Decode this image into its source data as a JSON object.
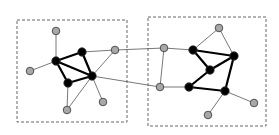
{
  "diagram": {
    "type": "network-graph",
    "colors": {
      "background": "#ffffff",
      "box_stroke": "#666666",
      "core_node_fill": "#000000",
      "peripheral_node_fill": "#a8a8a8",
      "node_stroke": "#333333",
      "thin_edge": "#555555",
      "thick_edge": "#000000"
    },
    "groups": [
      {
        "id": "left-cluster",
        "x": 17,
        "y": 20,
        "w": 110,
        "h": 102
      },
      {
        "id": "right-cluster",
        "x": 148,
        "y": 17,
        "w": 118,
        "h": 109
      }
    ],
    "nodes": [
      {
        "id": "L1",
        "kind": "peripheral",
        "x": 56,
        "y": 31
      },
      {
        "id": "L2",
        "kind": "core",
        "x": 56,
        "y": 61
      },
      {
        "id": "L3",
        "kind": "peripheral",
        "x": 30,
        "y": 71
      },
      {
        "id": "L4",
        "kind": "core",
        "x": 82,
        "y": 52
      },
      {
        "id": "L5",
        "kind": "peripheral",
        "x": 115,
        "y": 50
      },
      {
        "id": "L6",
        "kind": "core",
        "x": 92,
        "y": 76
      },
      {
        "id": "L7",
        "kind": "core",
        "x": 68,
        "y": 83
      },
      {
        "id": "L8",
        "kind": "peripheral",
        "x": 67,
        "y": 110
      },
      {
        "id": "L9",
        "kind": "peripheral",
        "x": 103,
        "y": 102
      },
      {
        "id": "R1",
        "kind": "peripheral",
        "x": 164,
        "y": 48
      },
      {
        "id": "R2",
        "kind": "peripheral",
        "x": 160,
        "y": 87
      },
      {
        "id": "R3",
        "kind": "core",
        "x": 193,
        "y": 50
      },
      {
        "id": "R4",
        "kind": "core",
        "x": 189,
        "y": 87
      },
      {
        "id": "R5",
        "kind": "peripheral",
        "x": 219,
        "y": 28
      },
      {
        "id": "R6",
        "kind": "core",
        "x": 234,
        "y": 56
      },
      {
        "id": "R7",
        "kind": "core",
        "x": 210,
        "y": 70
      },
      {
        "id": "R8",
        "kind": "core",
        "x": 225,
        "y": 91
      },
      {
        "id": "R9",
        "kind": "peripheral",
        "x": 254,
        "y": 103
      },
      {
        "id": "R10",
        "kind": "peripheral",
        "x": 208,
        "y": 115
      }
    ],
    "edges": [
      {
        "from": "L1",
        "to": "L2",
        "weight": "thin"
      },
      {
        "from": "L3",
        "to": "L2",
        "weight": "thin"
      },
      {
        "from": "L2",
        "to": "L4",
        "weight": "thick"
      },
      {
        "from": "L2",
        "to": "L6",
        "weight": "thick"
      },
      {
        "from": "L2",
        "to": "L7",
        "weight": "thick"
      },
      {
        "from": "L4",
        "to": "L6",
        "weight": "thick"
      },
      {
        "from": "L7",
        "to": "L6",
        "weight": "thick"
      },
      {
        "from": "L4",
        "to": "L5",
        "weight": "thin"
      },
      {
        "from": "L6",
        "to": "L5",
        "weight": "thin"
      },
      {
        "from": "L7",
        "to": "L8",
        "weight": "thin"
      },
      {
        "from": "L6",
        "to": "L8",
        "weight": "thin"
      },
      {
        "from": "L6",
        "to": "L9",
        "weight": "thin"
      },
      {
        "from": "L5",
        "to": "R1",
        "weight": "thin"
      },
      {
        "from": "L6",
        "to": "R2",
        "weight": "thin"
      },
      {
        "from": "R1",
        "to": "R2",
        "weight": "thin"
      },
      {
        "from": "R1",
        "to": "R3",
        "weight": "thin"
      },
      {
        "from": "R2",
        "to": "R4",
        "weight": "thin"
      },
      {
        "from": "R3",
        "to": "R5",
        "weight": "thin"
      },
      {
        "from": "R5",
        "to": "R6",
        "weight": "thin"
      },
      {
        "from": "R3",
        "to": "R6",
        "weight": "thick"
      },
      {
        "from": "R3",
        "to": "R7",
        "weight": "thick"
      },
      {
        "from": "R7",
        "to": "R6",
        "weight": "thick"
      },
      {
        "from": "R7",
        "to": "R4",
        "weight": "thick"
      },
      {
        "from": "R4",
        "to": "R8",
        "weight": "thick"
      },
      {
        "from": "R6",
        "to": "R8",
        "weight": "thick"
      },
      {
        "from": "R8",
        "to": "R9",
        "weight": "thin"
      },
      {
        "from": "R8",
        "to": "R10",
        "weight": "thin"
      }
    ]
  }
}
